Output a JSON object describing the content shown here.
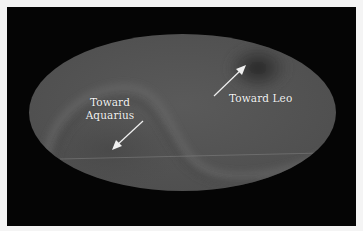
{
  "figure": {
    "type": "all-sky map (Mollweide projection)",
    "background_color": "#050505",
    "map_base_color": "#555555"
  },
  "annotations": {
    "leo": {
      "label": "Toward Leo",
      "arrow_direction": "up-right"
    },
    "aquarius": {
      "line1": "Toward",
      "line2": "Aquarius",
      "arrow_direction": "down-left"
    }
  },
  "colors": {
    "text": "#f2f2f2",
    "arrow": "#f0f0f0",
    "dark_hotspot": "#2a2a2a",
    "light_band": "#6a6a6a"
  }
}
